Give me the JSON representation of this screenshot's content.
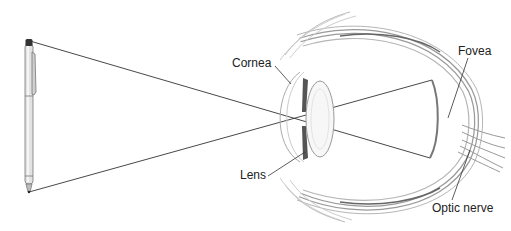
{
  "diagram": {
    "object": "pen",
    "labels": {
      "cornea": "Cornea",
      "lens": "Lens",
      "fovea": "Fovea",
      "optic_nerve": "Optic nerve"
    },
    "colors": {
      "line": "#333333",
      "tissue": "#9a9a9a",
      "tissue_light": "#cfcfcf",
      "dark_band": "#555555"
    }
  }
}
